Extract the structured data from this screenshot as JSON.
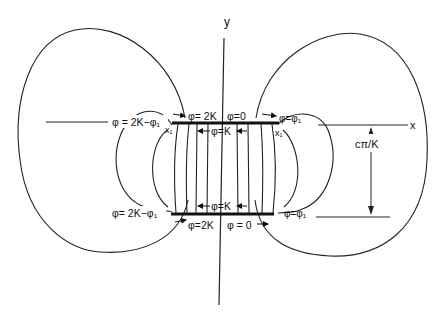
{
  "diagram": {
    "axes": {
      "x_label": "x",
      "y_label": "y"
    },
    "dimension_label": "cπ/K",
    "labels": {
      "top_left_arrow": "φ= 2K",
      "top_right_arrow": "φ=0",
      "top_middle": "φ=K",
      "bottom_middle": "φ=K",
      "bottom_left_arrow": "φ=2K",
      "bottom_right_arrow": "φ = 0",
      "left_upper": "φ = 2K−φ₁",
      "left_lower": "φ= 2K−φ₁",
      "right_upper": "φ=φ₁",
      "right_lower": "φ=φ₁",
      "x1_left": "x₁",
      "x1_right": "x₁"
    }
  }
}
